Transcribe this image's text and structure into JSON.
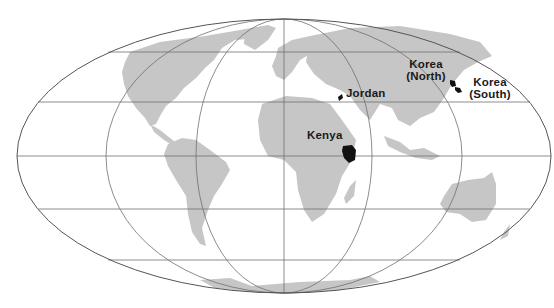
{
  "map": {
    "projection": "equal-area elliptical world map",
    "colors": {
      "background": "#ffffff",
      "land": "#c6c6c6",
      "highlight": "#111111",
      "graticule": "#6e6e6e"
    },
    "highlighted_countries": [
      {
        "id": "jordan",
        "label": "Jordan"
      },
      {
        "id": "kenya",
        "label": "Kenya"
      },
      {
        "id": "korea-north",
        "label_line1": "Korea",
        "label_line2": "(North)"
      },
      {
        "id": "korea-south",
        "label_line1": "Korea",
        "label_line2": "(South)"
      }
    ]
  }
}
